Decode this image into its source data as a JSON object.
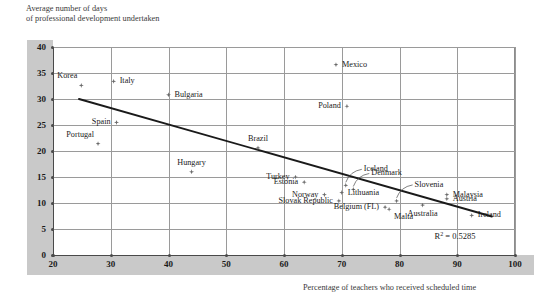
{
  "chart_data": {
    "type": "scatter",
    "title": "",
    "ylabel": "Average number of days\nof professional development undertaken",
    "xlabel": "Percentage of teachers who received scheduled time",
    "xlim": [
      20,
      100
    ],
    "ylim": [
      0,
      40
    ],
    "xticks": [
      20,
      30,
      40,
      50,
      60,
      70,
      80,
      90,
      100
    ],
    "yticks": [
      0,
      5,
      10,
      15,
      20,
      25,
      30,
      35,
      40
    ],
    "grid": true,
    "legend": null,
    "annotations": [
      {
        "name": "r-squared",
        "text": "R2 = 0.5285",
        "r2_value": 0.5285
      }
    ],
    "trendline": {
      "type": "linear",
      "x_start": 24.5,
      "y_start": 30.0,
      "x_end": 96.0,
      "y_end": 7.4,
      "r_squared": 0.5285
    },
    "points": [
      {
        "label": "Korea",
        "x": 24.9,
        "y": 32.6,
        "label_pos": "above-left"
      },
      {
        "label": "Italy",
        "x": 30.5,
        "y": 33.4,
        "label_pos": "right"
      },
      {
        "label": "Bulgaria",
        "x": 40.0,
        "y": 30.8,
        "label_pos": "right"
      },
      {
        "label": "Poland",
        "x": 70.9,
        "y": 28.6,
        "label_pos": "left"
      },
      {
        "label": "Mexico",
        "x": 69.0,
        "y": 36.6,
        "label_pos": "right"
      },
      {
        "label": "Spain",
        "x": 31.0,
        "y": 25.5,
        "label_pos": "left"
      },
      {
        "label": "Portugal",
        "x": 27.8,
        "y": 21.4,
        "label_pos": "above-left"
      },
      {
        "label": "Brazil",
        "x": 55.5,
        "y": 20.6,
        "label_pos": "above"
      },
      {
        "label": "Hungary",
        "x": 44.0,
        "y": 16.0,
        "label_pos": "above"
      },
      {
        "label": "Turkey",
        "x": 62.0,
        "y": 15.0,
        "label_pos": "left"
      },
      {
        "label": "Estonia",
        "x": 63.5,
        "y": 14.0,
        "label_pos": "left"
      },
      {
        "label": "Iceland",
        "x": 70.7,
        "y": 13.4,
        "label_pos": "leader-up-right"
      },
      {
        "label": "Denmark",
        "x": 72.0,
        "y": 12.6,
        "label_pos": "leader-up-right"
      },
      {
        "label": "Norway",
        "x": 67.0,
        "y": 11.6,
        "label_pos": "left"
      },
      {
        "label": "Lithuania",
        "x": 70.0,
        "y": 12.0,
        "label_pos": "right"
      },
      {
        "label": "Slovak Republic",
        "x": 69.5,
        "y": 10.4,
        "label_pos": "left"
      },
      {
        "label": "Belgium (FL)",
        "x": 77.5,
        "y": 9.2,
        "label_pos": "left"
      },
      {
        "label": "Malta",
        "x": 78.2,
        "y": 8.8,
        "label_pos": "below-right"
      },
      {
        "label": "Slovenia",
        "x": 79.5,
        "y": 10.4,
        "label_pos": "leader-up-right"
      },
      {
        "label": "Australia",
        "x": 84.0,
        "y": 9.6,
        "label_pos": "below"
      },
      {
        "label": "Malaysia",
        "x": 88.2,
        "y": 11.6,
        "label_pos": "right"
      },
      {
        "label": "Austria",
        "x": 88.2,
        "y": 10.8,
        "label_pos": "right"
      },
      {
        "label": "Ireland",
        "x": 92.5,
        "y": 7.6,
        "label_pos": "right"
      }
    ]
  }
}
